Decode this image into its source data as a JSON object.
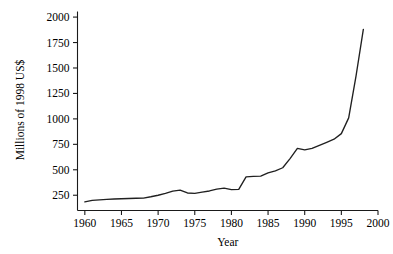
{
  "chart_data": {
    "type": "line",
    "title": "",
    "xlabel": "Year",
    "ylabel": "Millions of 1998 US$",
    "xlim": [
      1959,
      2000
    ],
    "ylim": [
      100,
      2050
    ],
    "xticks": [
      1960,
      1965,
      1970,
      1975,
      1980,
      1985,
      1990,
      1995,
      2000
    ],
    "yticks": [
      250,
      500,
      750,
      1000,
      1250,
      1500,
      1750,
      2000
    ],
    "xtick_labels": [
      "1960",
      "1965",
      "1970",
      "1975",
      "1980",
      "1985",
      "1990",
      "1995",
      "2000"
    ],
    "ytick_labels": [
      "250",
      "500",
      "750",
      "1000",
      "1250",
      "1500",
      "1750",
      "2000"
    ],
    "grid": false,
    "legend": false,
    "series": [
      {
        "name": "Expenditure",
        "color": "#202020",
        "x": [
          1960,
          1961,
          1962,
          1963,
          1964,
          1965,
          1966,
          1967,
          1968,
          1969,
          1970,
          1971,
          1972,
          1973,
          1974,
          1975,
          1976,
          1977,
          1978,
          1979,
          1980,
          1981,
          1982,
          1983,
          1984,
          1985,
          1986,
          1987,
          1988,
          1989,
          1990,
          1991,
          1992,
          1993,
          1994,
          1995,
          1996,
          1997,
          1998
        ],
        "values": [
          185,
          200,
          205,
          210,
          213,
          215,
          218,
          220,
          222,
          235,
          250,
          268,
          290,
          300,
          272,
          268,
          280,
          292,
          310,
          320,
          305,
          308,
          430,
          435,
          438,
          470,
          490,
          520,
          610,
          710,
          695,
          710,
          740,
          770,
          800,
          855,
          1010,
          1420,
          1880
        ]
      }
    ]
  },
  "axis": {
    "x_label": "Year",
    "y_label": "Millions of 1998 US$"
  }
}
